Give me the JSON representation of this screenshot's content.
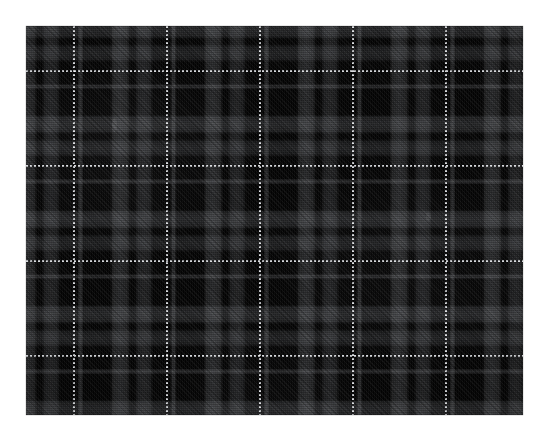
{
  "image": {
    "kind": "fabric-swatch-photograph",
    "subject": "black tartan plaid woven fabric",
    "alt_text": "Close-up photograph of black plaid tartan fabric with faint gray check bands and thin white dotted overcheck lines",
    "background_color": "#ffffff",
    "swatch": {
      "left": 26,
      "top": 26,
      "width": 497,
      "height": 389
    }
  },
  "palette": {
    "ground": "#040404",
    "deep_black": "#050505",
    "charcoal_band": "#4c4e50",
    "charcoal_band_light": "#565860",
    "mid_gray_accent": "#787a7e",
    "overcheck_white": "#e2e4e8",
    "page_white": "#ffffff"
  },
  "pattern": {
    "weave": "twill",
    "twill_direction": "45deg",
    "repeat_width_px": 93,
    "repeat_height_px": 95,
    "vertical_overcheck_x": [
      73,
      166,
      259,
      352,
      445
    ],
    "horizontal_overcheck_y": [
      70,
      165,
      260,
      355
    ],
    "dash_on_px": 2,
    "dash_off_px": 2,
    "band_pairs_per_repeat": 2
  },
  "flecks": [
    {
      "left": 86,
      "top": 92,
      "width": 5,
      "height": 14,
      "opacity": 0.34
    },
    {
      "left": 400,
      "top": 186,
      "width": 5,
      "height": 9,
      "opacity": 0.28
    },
    {
      "left": 212,
      "top": 300,
      "width": 3,
      "height": 5,
      "opacity": 0.2
    },
    {
      "left": 318,
      "top": 112,
      "width": 3,
      "height": 4,
      "opacity": 0.16
    }
  ]
}
